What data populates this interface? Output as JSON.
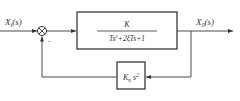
{
  "diagram": {
    "type": "block-diagram",
    "input": {
      "symbol": "X",
      "subscript": "i",
      "arg": "(s)"
    },
    "output": {
      "symbol": "X",
      "subscript": "0",
      "arg": "(s)"
    },
    "summing_junction": {
      "feedback_sign": "−"
    },
    "forward_block": {
      "numerator": "K",
      "denominator_parts": [
        "Ts",
        "2",
        "+2ξ",
        "Ts+1"
      ]
    },
    "feedback_block": {
      "symbol": "K",
      "subscript": "n",
      "var": "s",
      "power": "2"
    }
  }
}
